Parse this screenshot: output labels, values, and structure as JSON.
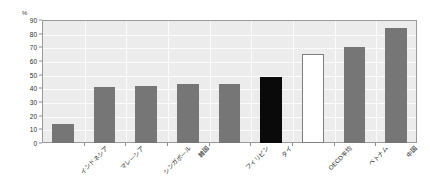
{
  "chart_data": {
    "type": "bar",
    "title": "",
    "xlabel": "",
    "ylabel": "%",
    "unit_label": "%",
    "ylim": [
      0,
      90
    ],
    "ytick_step": 10,
    "yticks": [
      0,
      10,
      20,
      30,
      40,
      50,
      60,
      70,
      80,
      90
    ],
    "grid": true,
    "grid_orientation": "both",
    "legend": "none",
    "categories": [
      "インドネシア",
      "マレーシア",
      "シンガポール",
      "韓国",
      "フィリピン",
      "タイ",
      "OECD平均",
      "ベトナム",
      "中国"
    ],
    "values": [
      14,
      41,
      42,
      43,
      43,
      48,
      65,
      70,
      84
    ],
    "bar_styles": [
      "gray",
      "gray",
      "gray",
      "gray",
      "gray",
      "black",
      "white",
      "gray",
      "gray"
    ],
    "colors": {
      "bar_gray": "#767676",
      "bar_black": "#0a0a0a",
      "bar_white": "#ffffff",
      "bar_white_border": "#7d7d7d",
      "plot_background": "#ececed",
      "gridline": "#fcfcfc",
      "frame_border": "#9a9a9a",
      "text": "#2b2b2b"
    }
  }
}
